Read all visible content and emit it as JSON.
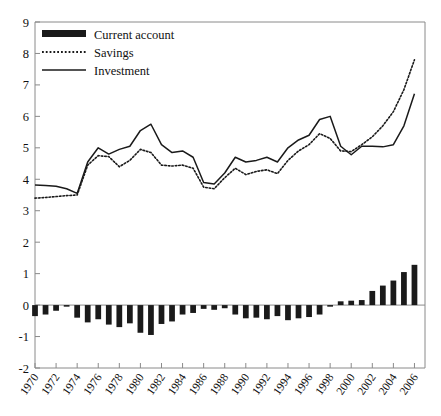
{
  "chart_data": {
    "type": "line",
    "title": "",
    "subtitle": "",
    "xlabel": "",
    "ylabel": "",
    "xlim": [
      1970,
      2007
    ],
    "ylim": [
      -2,
      9
    ],
    "ytick_step": 1,
    "xtick_step": 2,
    "grid": false,
    "legend_position": "top-left",
    "yticks": [
      "9",
      "8",
      "7",
      "6",
      "5",
      "4",
      "3",
      "2",
      "1",
      "0",
      "-1",
      "-2"
    ],
    "xticks": [
      "1970",
      "1972",
      "1974",
      "1976",
      "1978",
      "1980",
      "1982",
      "1984",
      "1986",
      "1988",
      "1990",
      "1992",
      "1994",
      "1996",
      "1998",
      "2000",
      "2002",
      "2004",
      "2006"
    ],
    "x": [
      1970,
      1971,
      1972,
      1973,
      1974,
      1975,
      1976,
      1977,
      1978,
      1979,
      1980,
      1981,
      1982,
      1983,
      1984,
      1985,
      1986,
      1987,
      1988,
      1989,
      1990,
      1991,
      1992,
      1993,
      1994,
      1995,
      1996,
      1997,
      1998,
      1999,
      2000,
      2001,
      2002,
      2003,
      2004,
      2005,
      2006
    ],
    "series": [
      {
        "name": "Current account",
        "style": "bar",
        "color": "#1a1a1a",
        "values": [
          -0.35,
          -0.3,
          -0.18,
          -0.05,
          -0.4,
          -0.55,
          -0.45,
          -0.62,
          -0.7,
          -0.58,
          -0.88,
          -0.95,
          -0.6,
          -0.52,
          -0.3,
          -0.25,
          -0.12,
          -0.15,
          -0.1,
          -0.3,
          -0.42,
          -0.4,
          -0.45,
          -0.35,
          -0.48,
          -0.42,
          -0.38,
          -0.3,
          -0.05,
          0.12,
          0.14,
          0.16,
          0.45,
          0.62,
          0.78,
          1.05,
          1.28
        ]
      },
      {
        "name": "Savings",
        "style": "dotted-line",
        "color": "#1a1a1a",
        "values": [
          3.4,
          3.42,
          3.45,
          3.48,
          3.5,
          4.45,
          4.75,
          4.72,
          4.4,
          4.6,
          4.95,
          4.85,
          4.45,
          4.42,
          4.45,
          4.35,
          3.75,
          3.7,
          4.05,
          4.35,
          4.15,
          4.25,
          4.3,
          4.18,
          4.6,
          4.9,
          5.1,
          5.45,
          5.3,
          4.9,
          4.88,
          5.1,
          5.35,
          5.7,
          6.15,
          6.85,
          7.8
        ]
      },
      {
        "name": "Investment",
        "style": "solid-line",
        "color": "#1a1a1a",
        "values": [
          3.82,
          3.8,
          3.78,
          3.7,
          3.55,
          4.55,
          5.0,
          4.8,
          4.95,
          5.05,
          5.55,
          5.75,
          5.1,
          4.85,
          4.9,
          4.7,
          3.9,
          3.85,
          4.2,
          4.7,
          4.55,
          4.6,
          4.7,
          4.55,
          5.0,
          5.25,
          5.4,
          5.9,
          6.0,
          5.05,
          4.78,
          5.05,
          5.05,
          5.03,
          5.1,
          5.7,
          6.72
        ]
      }
    ],
    "legend": [
      {
        "label": "Current account",
        "marker": "thick-bar"
      },
      {
        "label": "Savings",
        "marker": "dotted-line"
      },
      {
        "label": "Investment",
        "marker": "solid-line"
      }
    ],
    "axis_color": "#8a8a8a"
  }
}
